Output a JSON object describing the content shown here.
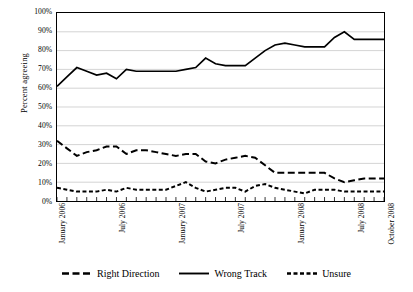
{
  "chart_data": {
    "type": "line",
    "title": "",
    "xlabel": "",
    "ylabel": "Percent agreeing",
    "ylim": [
      0,
      100
    ],
    "grid": true,
    "legend_position": "bottom",
    "x": [
      "January 2006",
      "February 2006",
      "March 2006",
      "April 2006",
      "May 2006",
      "June 2006",
      "July 2006",
      "August 2006",
      "September 2006",
      "October 2006",
      "November 2006",
      "December 2006",
      "January 2007",
      "February 2007",
      "March 2007",
      "April 2007",
      "May 2007",
      "June 2007",
      "July 2007",
      "August 2007",
      "September 2007",
      "October 2007",
      "November 2007",
      "December 2007",
      "January 2008",
      "February 2008",
      "March 2008",
      "April 2008",
      "May 2008",
      "June 2008",
      "July 2008",
      "August 2008",
      "September 2008",
      "October 2008"
    ],
    "tick_labels": [
      "January 2006",
      "July 2006",
      "January 2007",
      "July 2007",
      "January 2008",
      "July 2008",
      "October 2008"
    ],
    "tick_indices": [
      0,
      6,
      12,
      18,
      24,
      30,
      33
    ],
    "y_tick_labels": [
      "0%",
      "10%",
      "20%",
      "30%",
      "40%",
      "50%",
      "60%",
      "70%",
      "80%",
      "90%",
      "100%"
    ],
    "y_ticks": [
      0,
      10,
      20,
      30,
      40,
      50,
      60,
      70,
      80,
      90,
      100
    ],
    "series": [
      {
        "name": "Right Direction",
        "style": "long-dash",
        "color": "#000000",
        "values": [
          32,
          28,
          24,
          26,
          27,
          29,
          29,
          25,
          27,
          27,
          26,
          25,
          24,
          25,
          25,
          21,
          20,
          22,
          23,
          24,
          23,
          19,
          15,
          15,
          15,
          15,
          15,
          15,
          12,
          10,
          11,
          12,
          12,
          12
        ]
      },
      {
        "name": "Wrong Track",
        "style": "solid",
        "color": "#000000",
        "values": [
          61,
          66,
          71,
          69,
          67,
          68,
          65,
          70,
          69,
          69,
          69,
          69,
          69,
          70,
          71,
          76,
          73,
          72,
          72,
          72,
          76,
          80,
          83,
          84,
          83,
          82,
          82,
          82,
          87,
          90,
          86,
          86,
          86,
          86
        ]
      },
      {
        "name": "Unsure",
        "style": "short-dash",
        "color": "#000000",
        "values": [
          7,
          6,
          5,
          5,
          5,
          6,
          5,
          7,
          6,
          6,
          6,
          6,
          8,
          10,
          7,
          5,
          6,
          7,
          7,
          5,
          8,
          9,
          7,
          6,
          5,
          4,
          6,
          6,
          6,
          5,
          5,
          5,
          5,
          5
        ]
      }
    ]
  },
  "legend": {
    "items": [
      {
        "label": "Right Direction",
        "style": "long-dash"
      },
      {
        "label": "Wrong Track",
        "style": "solid"
      },
      {
        "label": "Unsure",
        "style": "short-dash"
      }
    ]
  }
}
